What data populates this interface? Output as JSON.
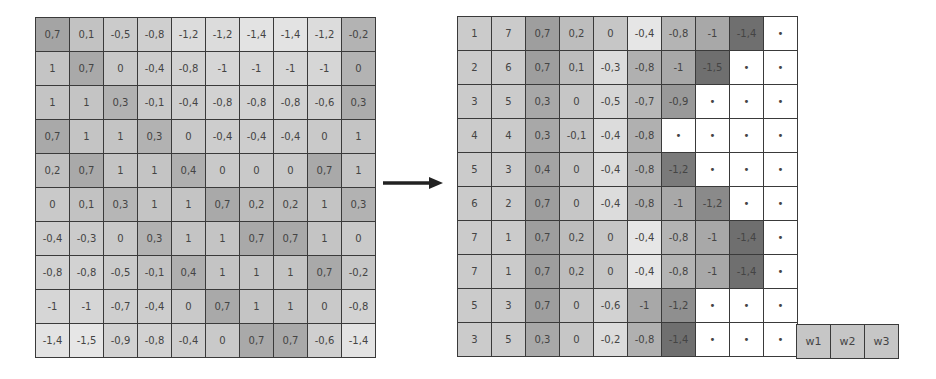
{
  "left_grid": {
    "rows": [
      [
        "0,7",
        "0,1",
        "-0,5",
        "-0,8",
        "-1,2",
        "-1,2",
        "-1,4",
        "-1,4",
        "-1,2",
        "-0,2"
      ],
      [
        "1",
        "0,7",
        "0",
        "-0,4",
        "-0,8",
        "-1",
        "-1",
        "-1",
        "-1",
        "0"
      ],
      [
        "1",
        "1",
        "0,3",
        "-0,1",
        "-0,4",
        "-0,8",
        "-0,8",
        "-0,8",
        "-0,6",
        "0,3"
      ],
      [
        "0,7",
        "1",
        "1",
        "0,3",
        "0",
        "-0,4",
        "-0,4",
        "-0,4",
        "0",
        "1"
      ],
      [
        "0,2",
        "0,7",
        "1",
        "1",
        "0,4",
        "0",
        "0",
        "0",
        "0,7",
        "1"
      ],
      [
        "0",
        "0,1",
        "0,3",
        "1",
        "1",
        "0,7",
        "0,2",
        "0,2",
        "1",
        "0,3"
      ],
      [
        "-0,4",
        "-0,3",
        "0",
        "0,3",
        "1",
        "1",
        "0,7",
        "0,7",
        "1",
        "0"
      ],
      [
        "-0,8",
        "-0,8",
        "-0,5",
        "-0,1",
        "0,4",
        "1",
        "1",
        "1",
        "0,7",
        "-0,2"
      ],
      [
        "-1",
        "-1",
        "-0,7",
        "-0,4",
        "0",
        "0,7",
        "1",
        "1",
        "0",
        "-0,8"
      ],
      [
        "-1,4",
        "-1,5",
        "-0,9",
        "-0,8",
        "-0,4",
        "0",
        "0,7",
        "0,7",
        "-0,6",
        "-1,4"
      ]
    ],
    "shades": [
      [
        "#a4a4a4",
        "#c2c2c2",
        "#cbcbcb",
        "#cfcfcf",
        "#dcdcdc",
        "#dcdcdc",
        "#e3e3e3",
        "#e3e3e3",
        "#dcdcdc",
        "#b3b3b3"
      ],
      [
        "#c4c4c4",
        "#a9a9a9",
        "#c9c9c9",
        "#cdcdcd",
        "#d2d2d2",
        "#d6d6d6",
        "#d6d6d6",
        "#d6d6d6",
        "#d6d6d6",
        "#b3b3b3"
      ],
      [
        "#c4c4c4",
        "#c4c4c4",
        "#b2b2b2",
        "#c9c9c9",
        "#cdcdcd",
        "#d2d2d2",
        "#d2d2d2",
        "#d2d2d2",
        "#cfcfcf",
        "#acacac"
      ],
      [
        "#a9a9a9",
        "#c4c4c4",
        "#c4c4c4",
        "#b2b2b2",
        "#c9c9c9",
        "#cdcdcd",
        "#cdcdcd",
        "#cdcdcd",
        "#c9c9c9",
        "#c4c4c4"
      ],
      [
        "#c0c0c0",
        "#a9a9a9",
        "#c4c4c4",
        "#c4c4c4",
        "#afafaf",
        "#c9c9c9",
        "#c9c9c9",
        "#c9c9c9",
        "#a9a9a9",
        "#c4c4c4"
      ],
      [
        "#c9c9c9",
        "#c2c2c2",
        "#b6b6b6",
        "#c4c4c4",
        "#c4c4c4",
        "#a9a9a9",
        "#bcbcbc",
        "#bcbcbc",
        "#c4c4c4",
        "#b2b2b2"
      ],
      [
        "#cdcdcd",
        "#cbcbcb",
        "#c9c9c9",
        "#b2b2b2",
        "#c4c4c4",
        "#c4c4c4",
        "#a9a9a9",
        "#a9a9a9",
        "#c4c4c4",
        "#c9c9c9"
      ],
      [
        "#d2d2d2",
        "#d2d2d2",
        "#cbcbcb",
        "#c2c2c2",
        "#afafaf",
        "#c4c4c4",
        "#c4c4c4",
        "#c4c4c4",
        "#a9a9a9",
        "#c6c6c6"
      ],
      [
        "#d6d6d6",
        "#d6d6d6",
        "#cfcfcf",
        "#cdcdcd",
        "#c9c9c9",
        "#a9a9a9",
        "#c4c4c4",
        "#c4c4c4",
        "#c9c9c9",
        "#d2d2d2"
      ],
      [
        "#e3e3e3",
        "#e6e6e6",
        "#d2d2d2",
        "#d2d2d2",
        "#cdcdcd",
        "#c9c9c9",
        "#a9a9a9",
        "#a9a9a9",
        "#cfcfcf",
        "#e3e3e3"
      ]
    ]
  },
  "arrow": {
    "direction": "right",
    "color": "#222222"
  },
  "right_grid": {
    "rows": [
      [
        "1",
        "7",
        "0,7",
        "0,2",
        "0",
        "-0,4",
        "-0,8",
        "-1",
        "-1,4",
        "•"
      ],
      [
        "2",
        "6",
        "0,7",
        "0,1",
        "-0,3",
        "-0,8",
        "-1",
        "-1,5",
        "•",
        "•"
      ],
      [
        "3",
        "5",
        "0,3",
        "0",
        "-0,5",
        "-0,7",
        "-0,9",
        "•",
        "•",
        "•"
      ],
      [
        "4",
        "4",
        "0,3",
        "-0,1",
        "-0,4",
        "-0,8",
        "•",
        "•",
        "•",
        "•"
      ],
      [
        "5",
        "3",
        "0,4",
        "0",
        "-0,4",
        "-0,8",
        "-1,2",
        "•",
        "•",
        "•"
      ],
      [
        "6",
        "2",
        "0,7",
        "0",
        "-0,4",
        "-0,8",
        "-1",
        "-1,2",
        "•",
        "•"
      ],
      [
        "7",
        "1",
        "0,7",
        "0,2",
        "0",
        "-0,4",
        "-0,8",
        "-1",
        "-1,4",
        "•"
      ],
      [
        "7",
        "1",
        "0,7",
        "0,2",
        "0",
        "-0,4",
        "-0,8",
        "-1",
        "-1,4",
        "•"
      ],
      [
        "5",
        "3",
        "0,7",
        "0",
        "-0,6",
        "-1",
        "-1,2",
        "•",
        "•",
        "•"
      ],
      [
        "3",
        "5",
        "0,3",
        "0",
        "-0,2",
        "-0,8",
        "-1,4",
        "•",
        "•",
        "•"
      ]
    ],
    "shades": [
      [
        "#cbcbcb",
        "#cbcbcb",
        "#9e9e9e",
        "#bdbdbd",
        "#c6c6c6",
        "#e6e6e6",
        "#b4b4b4",
        "#a8a8a8",
        "#6f6f6f",
        "#ffffff"
      ],
      [
        "#cbcbcb",
        "#cbcbcb",
        "#9e9e9e",
        "#bdbdbd",
        "#dcdcdc",
        "#b0b0b0",
        "#a8a8a8",
        "#6f6f6f",
        "#ffffff",
        "#ffffff"
      ],
      [
        "#cbcbcb",
        "#cbcbcb",
        "#a8a8a8",
        "#c6c6c6",
        "#d6d6d6",
        "#b8b8b8",
        "#999999",
        "#ffffff",
        "#ffffff",
        "#ffffff"
      ],
      [
        "#cbcbcb",
        "#cbcbcb",
        "#a8a8a8",
        "#c6c6c6",
        "#dcdcdc",
        "#b0b0b0",
        "#ffffff",
        "#ffffff",
        "#ffffff",
        "#ffffff"
      ],
      [
        "#cbcbcb",
        "#cbcbcb",
        "#a4a4a4",
        "#c6c6c6",
        "#dcdcdc",
        "#b0b0b0",
        "#7a7a7a",
        "#ffffff",
        "#ffffff",
        "#ffffff"
      ],
      [
        "#cbcbcb",
        "#cbcbcb",
        "#9e9e9e",
        "#c6c6c6",
        "#dcdcdc",
        "#b0b0b0",
        "#a8a8a8",
        "#8a8a8a",
        "#ffffff",
        "#ffffff"
      ],
      [
        "#cbcbcb",
        "#cbcbcb",
        "#9e9e9e",
        "#bdbdbd",
        "#c6c6c6",
        "#e6e6e6",
        "#b4b4b4",
        "#a8a8a8",
        "#6f6f6f",
        "#ffffff"
      ],
      [
        "#cbcbcb",
        "#cbcbcb",
        "#9e9e9e",
        "#bdbdbd",
        "#c6c6c6",
        "#e6e6e6",
        "#b4b4b4",
        "#a8a8a8",
        "#6f6f6f",
        "#ffffff"
      ],
      [
        "#cbcbcb",
        "#cbcbcb",
        "#9e9e9e",
        "#c6c6c6",
        "#d2d2d2",
        "#a8a8a8",
        "#8f8f8f",
        "#ffffff",
        "#ffffff",
        "#ffffff"
      ],
      [
        "#cbcbcb",
        "#cbcbcb",
        "#a8a8a8",
        "#c6c6c6",
        "#dcdcdc",
        "#b0b0b0",
        "#6f6f6f",
        "#ffffff",
        "#ffffff",
        "#ffffff"
      ]
    ]
  },
  "weight_cells": [
    "w1",
    "w2",
    "w3"
  ]
}
